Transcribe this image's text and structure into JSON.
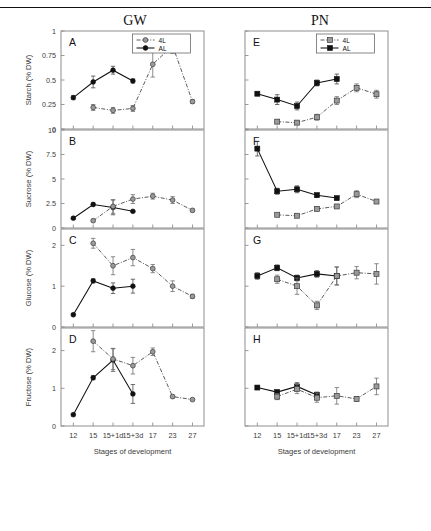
{
  "figure": {
    "column_headers": [
      "GW",
      "PN"
    ],
    "xlabel": "Stages of development",
    "cut_text_top": "",
    "legend": {
      "series_4l": "4L",
      "series_AL": "AL"
    }
  },
  "chart_data": {
    "type": "line",
    "xlabel": "Stages of development",
    "categories": [
      "12",
      "15",
      "15+1d",
      "15+3d",
      "17",
      "23",
      "27"
    ],
    "legend_position": "top-center-inside",
    "grid": false,
    "panels": [
      {
        "letter": "A",
        "column": "GW",
        "ylabel": "Starch (% DW)",
        "ylim": [
          0,
          1
        ],
        "yticks": [
          0,
          0.25,
          0.5,
          0.75,
          1
        ],
        "yticklabels": [
          "0",
          "0.25",
          "0.5",
          "0.75",
          "1"
        ],
        "series": [
          {
            "name": "AL",
            "style": "solid",
            "marker": "filled-circle",
            "values": [
              0.32,
              0.48,
              0.6,
              0.49,
              null,
              null,
              null
            ],
            "errors": [
              0.02,
              0.06,
              0.04,
              0.02,
              null,
              null,
              null
            ]
          },
          {
            "name": "4L",
            "style": "dash-dot",
            "marker": "open-circle",
            "values": [
              null,
              0.22,
              0.19,
              0.21,
              0.66,
              0.85,
              0.28
            ],
            "errors": [
              null,
              0.03,
              0.03,
              0.03,
              0.13,
              0.08,
              0.02
            ]
          }
        ]
      },
      {
        "letter": "B",
        "column": "GW",
        "ylabel": "Sucrose (% DW)",
        "ylim": [
          0,
          10
        ],
        "yticks": [
          0,
          2.5,
          5,
          7.5,
          10
        ],
        "yticklabels": [
          "0",
          "2.5",
          "5",
          "7.5",
          "10"
        ],
        "series": [
          {
            "name": "AL",
            "style": "solid",
            "marker": "filled-circle",
            "values": [
              1.0,
              2.4,
              2.1,
              1.7,
              null,
              null,
              null
            ],
            "errors": [
              0.1,
              0.15,
              0.75,
              0.1,
              null,
              null,
              null
            ]
          },
          {
            "name": "4L",
            "style": "dash-dot",
            "marker": "open-circle",
            "values": [
              null,
              0.75,
              2.2,
              2.95,
              3.25,
              2.85,
              1.8
            ],
            "errors": [
              null,
              0.1,
              0.7,
              0.45,
              0.3,
              0.35,
              0.15
            ]
          }
        ]
      },
      {
        "letter": "C",
        "column": "GW",
        "ylabel": "Glucose (% DW)",
        "ylim": [
          0,
          2.4
        ],
        "yticks": [
          0,
          1,
          2
        ],
        "yticklabels": [
          "0",
          "1",
          "2"
        ],
        "series": [
          {
            "name": "AL",
            "style": "solid",
            "marker": "filled-circle",
            "values": [
              0.3,
              1.13,
              0.95,
              1.0,
              null,
              null,
              null
            ],
            "errors": [
              0.02,
              0.05,
              0.13,
              0.17,
              null,
              null,
              null
            ]
          },
          {
            "name": "4L",
            "style": "dash-dot",
            "marker": "open-circle",
            "values": [
              null,
              2.05,
              1.5,
              1.7,
              1.43,
              1.0,
              0.75
            ],
            "errors": [
              null,
              0.12,
              0.22,
              0.2,
              0.1,
              0.13,
              0.05
            ]
          }
        ]
      },
      {
        "letter": "D",
        "column": "GW",
        "ylabel": "Fructose (% DW)",
        "ylim": [
          0,
          2.6
        ],
        "yticks": [
          0,
          1,
          2
        ],
        "yticklabels": [
          "0",
          "1",
          "2"
        ],
        "series": [
          {
            "name": "AL",
            "style": "solid",
            "marker": "filled-circle",
            "values": [
              0.3,
              1.28,
              1.75,
              0.85,
              null,
              null,
              null
            ],
            "errors": [
              0.03,
              0.05,
              0.3,
              0.25,
              null,
              null,
              null
            ]
          },
          {
            "name": "4L",
            "style": "dash-dot",
            "marker": "open-circle",
            "values": [
              null,
              2.25,
              1.78,
              1.6,
              1.97,
              0.78,
              0.7
            ],
            "errors": [
              null,
              0.28,
              0.28,
              0.22,
              0.1,
              0.04,
              0.03
            ]
          }
        ]
      },
      {
        "letter": "E",
        "column": "PN",
        "ylabel": "Starch (% DW)",
        "ylim": [
          0,
          1
        ],
        "yticks": [
          0,
          0.25,
          0.5,
          0.75,
          1
        ],
        "yticklabels": [],
        "series": [
          {
            "name": "AL",
            "style": "solid",
            "marker": "filled-square",
            "values": [
              0.36,
              0.3,
              0.235,
              0.47,
              0.51,
              null,
              null
            ],
            "errors": [
              0.015,
              0.05,
              0.04,
              0.03,
              0.05,
              null,
              null
            ]
          },
          {
            "name": "4L",
            "style": "dash-dot",
            "marker": "open-square",
            "values": [
              null,
              0.075,
              0.065,
              0.12,
              0.29,
              0.42,
              0.355
            ],
            "errors": [
              null,
              0.02,
              0.02,
              0.03,
              0.04,
              0.04,
              0.04
            ]
          }
        ]
      },
      {
        "letter": "F",
        "column": "PN",
        "ylabel": "Sucrose (% DW)",
        "ylim": [
          0,
          10
        ],
        "yticks": [
          0,
          2.5,
          5,
          7.5,
          10
        ],
        "yticklabels": [],
        "series": [
          {
            "name": "AL",
            "style": "solid",
            "marker": "filled-square",
            "values": [
              8.1,
              3.75,
              3.95,
              3.35,
              3.05,
              null,
              null
            ],
            "errors": [
              0.75,
              0.3,
              0.35,
              0.2,
              0.15,
              null,
              null
            ]
          },
          {
            "name": "4L",
            "style": "dash-dot",
            "marker": "open-square",
            "values": [
              null,
              1.35,
              1.25,
              1.95,
              2.2,
              3.45,
              2.7
            ],
            "errors": [
              null,
              0.1,
              0.12,
              0.15,
              0.2,
              0.35,
              0.15
            ]
          }
        ]
      },
      {
        "letter": "G",
        "column": "PN",
        "ylabel": "Glucose (% DW)",
        "ylim": [
          0,
          2.4
        ],
        "yticks": [
          0,
          1,
          2
        ],
        "yticklabels": [],
        "series": [
          {
            "name": "AL",
            "style": "solid",
            "marker": "filled-square",
            "values": [
              1.25,
              1.45,
              1.2,
              1.3,
              1.25,
              null,
              null
            ],
            "errors": [
              0.08,
              0.07,
              0.07,
              0.08,
              0.22,
              null,
              null
            ]
          },
          {
            "name": "4L",
            "style": "dash-dot",
            "marker": "open-square",
            "values": [
              null,
              1.17,
              1.0,
              0.53,
              1.25,
              1.33,
              1.3
            ],
            "errors": [
              null,
              0.1,
              0.2,
              0.1,
              0.22,
              0.15,
              0.25
            ]
          }
        ]
      },
      {
        "letter": "H",
        "column": "PN",
        "ylabel": "Fructose (% DW)",
        "ylim": [
          0,
          2.6
        ],
        "yticks": [
          0,
          1,
          2
        ],
        "yticklabels": [],
        "series": [
          {
            "name": "AL",
            "style": "solid",
            "marker": "filled-square",
            "values": [
              1.02,
              0.9,
              1.05,
              0.82,
              null,
              null,
              null
            ],
            "errors": [
              0.03,
              0.05,
              0.1,
              0.08,
              null,
              null,
              null
            ]
          },
          {
            "name": "4L",
            "style": "dash-dot",
            "marker": "open-square",
            "values": [
              null,
              0.78,
              0.98,
              0.75,
              0.8,
              0.72,
              1.05
            ],
            "errors": [
              null,
              0.08,
              0.12,
              0.12,
              0.22,
              0.06,
              0.22
            ]
          }
        ]
      }
    ]
  }
}
